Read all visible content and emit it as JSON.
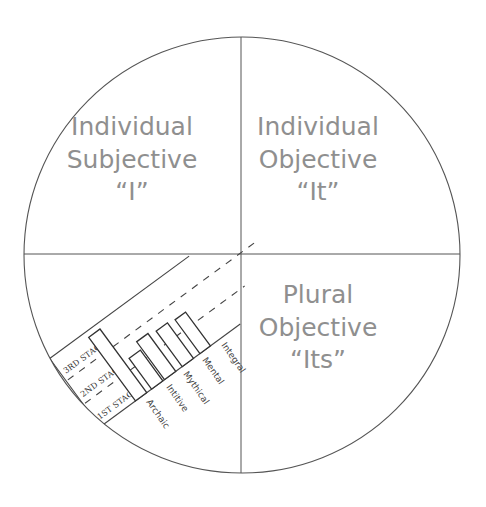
{
  "diagram": {
    "type": "four-quadrant circle",
    "circle": {
      "cx": 242,
      "cy": 255,
      "r": 218,
      "stroke": "#555555"
    },
    "quadrants": [
      {
        "id": "upper-left",
        "lines": [
          "Individual",
          "Subjective",
          "“I”"
        ]
      },
      {
        "id": "upper-right",
        "lines": [
          "Individual",
          "Objective",
          "“It”"
        ]
      },
      {
        "id": "lower-right",
        "lines": [
          "Plural",
          "Objective",
          "“Its”"
        ]
      },
      {
        "id": "lower-left",
        "lines": []
      }
    ],
    "text_color": "#8f8f8f"
  },
  "stage_chart": {
    "stages": [
      "1st Stage",
      "2nd Stage",
      "3rd Stage"
    ],
    "stage_labels_display": [
      "1ST STAGE",
      "2ND STAGE",
      "3RD STAGE"
    ],
    "categories": [
      "Archaic",
      "Intitive",
      "Mythical",
      "Mental",
      "Integral"
    ],
    "bars": [
      {
        "label": "tall",
        "height": 79
      },
      {
        "label": "Archaic",
        "height": 38
      },
      {
        "label": "Intitive",
        "height": 47
      },
      {
        "label": "Mythical",
        "height": 44
      },
      {
        "label": "Mental",
        "height": 42
      }
    ]
  }
}
